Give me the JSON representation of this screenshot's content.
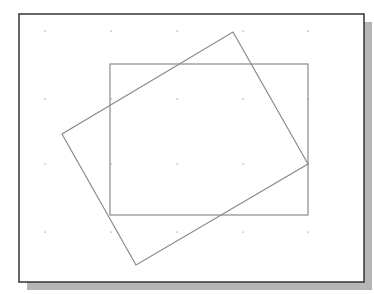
{
  "figure": {
    "colors": {
      "background": "#ffffff",
      "frame": "#333333",
      "shadow": "#b5b5b5",
      "shape_stroke": "#8a8a8a",
      "grid_dot": "#9a9a9a"
    },
    "frame": {
      "x": 19,
      "y": 14,
      "width": 345,
      "height": 268
    },
    "shadow": {
      "offset_x": 8,
      "offset_y": 8
    },
    "grid": {
      "xs": [
        45,
        111,
        177,
        243,
        308
      ],
      "ys": [
        31,
        99,
        164,
        232
      ]
    },
    "shapes": [
      {
        "name": "axis-aligned-rectangle",
        "type": "rect",
        "x": 110,
        "y": 64,
        "width": 198,
        "height": 151
      },
      {
        "name": "rotated-rectangle",
        "type": "polygon",
        "points": [
          [
            233,
            32
          ],
          [
            308,
            164
          ],
          [
            136,
            265
          ],
          [
            62,
            134
          ]
        ]
      }
    ]
  }
}
